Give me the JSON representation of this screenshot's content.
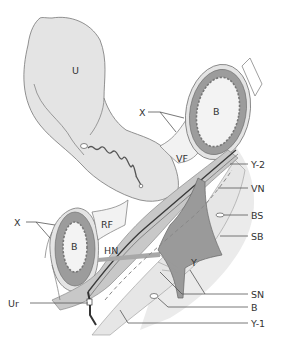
{
  "diagram": {
    "type": "anatomical-cross-section",
    "colors": {
      "background": "#ffffff",
      "organ_fill": "#e4e4e4",
      "organ_stroke": "#777777",
      "fascia_fill": "#c8c8c8",
      "nerve_fill": "#9a9a9a",
      "bowel_wall": "#9c9c9c",
      "bowel_lumen": "#f3f3f3",
      "sheet_light": "#ebebeb",
      "sheet_medium": "#d6d6d6"
    },
    "inner_labels": {
      "uterus": "U",
      "bowel_upper": "B",
      "bowel_lower": "B",
      "vesical_fossa": "VF",
      "rectal_fossa": "RF",
      "hypogastric_nerve": "HN",
      "y_structure": "Y"
    },
    "callouts": {
      "x_upper": "X",
      "x_lower": "X",
      "y2": "Y-2",
      "vn": "VN",
      "bs": "BS",
      "sb": "SB",
      "sn": "SN",
      "b": "B",
      "y1": "Y-1",
      "ur": "Ur"
    }
  }
}
